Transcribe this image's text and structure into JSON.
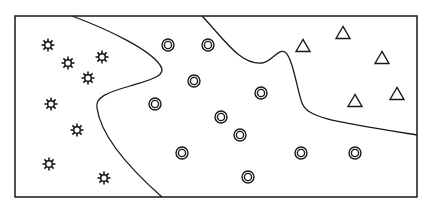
{
  "diagram": {
    "width": 429,
    "height": 221,
    "background": "#ffffff",
    "stroke_color": "#1a1a1a",
    "frame": {
      "x": 15,
      "y": 16,
      "width": 402,
      "height": 181
    },
    "boundaries": [
      {
        "name": "boundary-stars-circles",
        "path": "M72,16 C110,30 150,50 160,65 C168,76 150,80 130,86 C105,93 95,98 97,108 C100,130 120,160 162,197"
      },
      {
        "name": "boundary-circles-triangles",
        "path": "M202,16 C225,40 240,65 262,63 C272,62 278,48 285,52 C293,58 297,90 302,103 C308,118 330,121 417,135"
      }
    ],
    "classes": [
      {
        "name": "stars",
        "marker": "star",
        "points": [
          [
            48,
            45
          ],
          [
            68,
            63
          ],
          [
            102,
            57
          ],
          [
            88,
            78
          ],
          [
            51,
            104
          ],
          [
            77,
            130
          ],
          [
            49,
            164
          ],
          [
            104,
            178
          ]
        ]
      },
      {
        "name": "circles",
        "marker": "double-circle",
        "points": [
          [
            168,
            45
          ],
          [
            208,
            45
          ],
          [
            194,
            81
          ],
          [
            155,
            104
          ],
          [
            261,
            93
          ],
          [
            221,
            117
          ],
          [
            240,
            135
          ],
          [
            182,
            153
          ],
          [
            301,
            153
          ],
          [
            355,
            153
          ],
          [
            248,
            177
          ]
        ]
      },
      {
        "name": "triangles",
        "marker": "triangle",
        "points": [
          [
            303,
            46
          ],
          [
            343,
            33
          ],
          [
            382,
            58
          ],
          [
            355,
            101
          ],
          [
            397,
            94
          ]
        ]
      }
    ]
  }
}
